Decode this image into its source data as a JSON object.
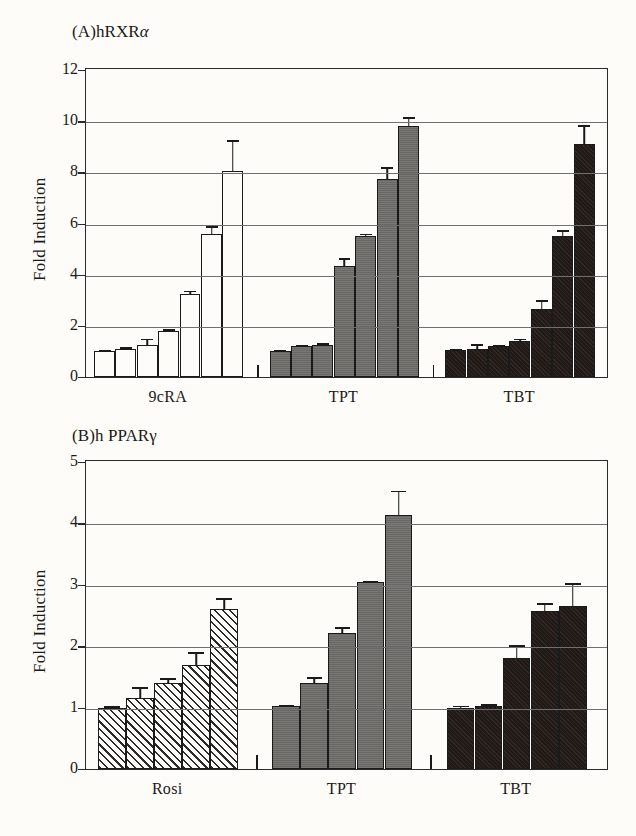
{
  "figure": {
    "background": "#fdfcf8",
    "ink": "#1a1a1a"
  },
  "panel_a": {
    "title_prefix": "(A)",
    "title_main": "hRXR",
    "title_symbol": "α",
    "ylabel": "Fold Induction",
    "yticks": [
      "0",
      "2",
      "4",
      "6",
      "8",
      "10",
      "12"
    ],
    "xlabels": [
      "9cRA",
      "TPT",
      "TBT"
    ]
  },
  "panel_b": {
    "title_prefix": "(B)",
    "title_main": "h PPAR",
    "title_symbol": "γ",
    "ylabel": "Fold Induction",
    "yticks": [
      "0",
      "1",
      "2",
      "3",
      "4",
      "5"
    ],
    "xlabels": [
      "Rosi",
      "TPT",
      "TBT"
    ]
  },
  "chart_data": [
    {
      "type": "bar",
      "title": "(A) hRXRα",
      "xlabel": "",
      "ylabel": "Fold Induction",
      "ylim": [
        0,
        12
      ],
      "yticks": [
        0,
        2,
        4,
        6,
        8,
        10,
        12
      ],
      "grid": true,
      "legend": "none",
      "groups": [
        {
          "name": "9cRA",
          "fill": "white",
          "color": "#fdfcf8",
          "values": [
            1.0,
            1.1,
            1.25,
            1.8,
            3.25,
            5.6,
            8.05
          ],
          "errors": [
            0.05,
            0.07,
            0.25,
            0.06,
            0.12,
            0.3,
            1.2
          ]
        },
        {
          "name": "TPT",
          "fill": "gray",
          "color": "#6f6d69",
          "values": [
            1.0,
            1.2,
            1.25,
            4.35,
            5.5,
            7.75,
            9.8
          ],
          "errors": [
            0.05,
            0.07,
            0.07,
            0.3,
            0.1,
            0.45,
            0.35
          ]
        },
        {
          "name": "TBT",
          "fill": "black",
          "color": "#241c18",
          "values": [
            1.05,
            1.1,
            1.2,
            1.4,
            2.65,
            5.5,
            9.1
          ],
          "errors": [
            0.05,
            0.18,
            0.06,
            0.1,
            0.35,
            0.25,
            0.75
          ]
        }
      ]
    },
    {
      "type": "bar",
      "title": "(B) h PPARγ",
      "xlabel": "",
      "ylabel": "Fold Induction",
      "ylim": [
        0,
        5
      ],
      "yticks": [
        0,
        1,
        2,
        3,
        4,
        5
      ],
      "grid": true,
      "legend": "none",
      "groups": [
        {
          "name": "Rosi",
          "fill": "hatch",
          "color": "#fdfcf8",
          "values": [
            1.0,
            1.15,
            1.4,
            1.7,
            2.6
          ],
          "errors": [
            0.02,
            0.18,
            0.08,
            0.2,
            0.18
          ]
        },
        {
          "name": "TPT",
          "fill": "gray",
          "color": "#6f6d69",
          "values": [
            1.02,
            1.4,
            2.22,
            3.05,
            4.13
          ],
          "errors": [
            0.03,
            0.1,
            0.09,
            0.02,
            0.4
          ]
        },
        {
          "name": "TBT",
          "fill": "black",
          "color": "#241c18",
          "values": [
            1.0,
            1.03,
            1.8,
            2.58,
            2.65
          ],
          "errors": [
            0.03,
            0.03,
            0.22,
            0.12,
            0.38
          ]
        }
      ]
    }
  ]
}
